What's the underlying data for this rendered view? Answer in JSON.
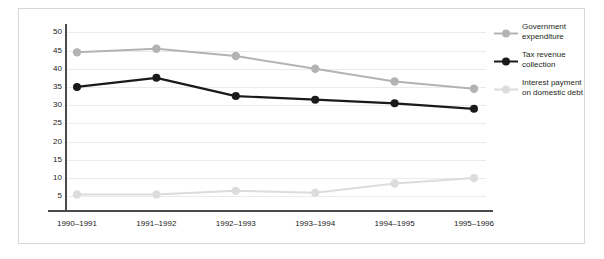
{
  "chart_data": {
    "type": "line",
    "title": "",
    "subtitle": "",
    "xlabel": "",
    "ylabel": "",
    "categories": [
      "1990–1991",
      "1991–1992",
      "1992–1993",
      "1993–1994",
      "1994–1995",
      "1995–1996"
    ],
    "yticks": [
      5,
      10,
      15,
      20,
      25,
      30,
      35,
      40,
      45,
      50
    ],
    "ylim": [
      0,
      52
    ],
    "grid": true,
    "legend_position": "right",
    "series": [
      {
        "name": "Government expenditure",
        "color": "#b3b3b3",
        "values": [
          44.5,
          45.5,
          43.5,
          40,
          36.5,
          34.5
        ]
      },
      {
        "name": "Tax revenue collection",
        "color": "#1a1a1a",
        "values": [
          35,
          37.5,
          32.5,
          31.5,
          30.5,
          29
        ]
      },
      {
        "name": "Interest payment on domestic debt",
        "color": "#dcdcdc",
        "values": [
          5.5,
          5.5,
          6.5,
          6,
          8.5,
          10
        ]
      }
    ]
  },
  "legend": {
    "items": [
      {
        "label": "Government expenditure",
        "color": "#b3b3b3"
      },
      {
        "label": "Tax revenue collection",
        "color": "#1a1a1a"
      },
      {
        "label": "Interest payment on domestic debt",
        "color": "#dcdcdc"
      }
    ]
  }
}
